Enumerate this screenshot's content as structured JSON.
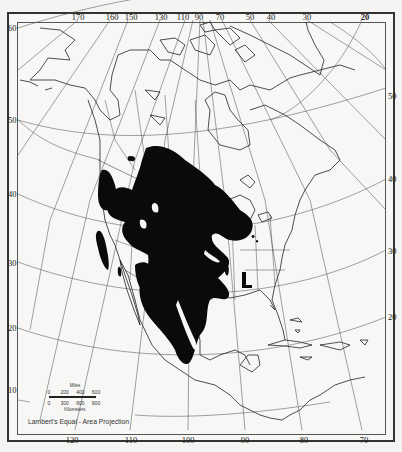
{
  "map": {
    "type": "thematic-region-map",
    "region": "North America",
    "projection_label": "Lambert's Equal - Area Projection",
    "fill_color": "#0a0a0a",
    "background_color": "#f7f7f5",
    "line_color": "#444444",
    "graticule": {
      "longitude_labels_top": [
        "170",
        "160",
        "150",
        "130",
        "110",
        "90",
        "70",
        "50",
        "40",
        "30",
        "20"
      ],
      "longitude_labels_bottom": [
        "120",
        "110",
        "100",
        "90",
        "80",
        "70"
      ],
      "latitude_labels_left": [
        "60",
        "50",
        "40",
        "30",
        "20",
        "10"
      ],
      "latitude_labels_right": [
        "50",
        "40",
        "30",
        "20"
      ]
    },
    "scale": {
      "miles_title": "Miles",
      "miles_ticks": [
        "0",
        "200",
        "400",
        "600"
      ],
      "km_title": "Kilometers",
      "km_ticks": [
        "0",
        "300",
        "600",
        "900"
      ]
    }
  }
}
